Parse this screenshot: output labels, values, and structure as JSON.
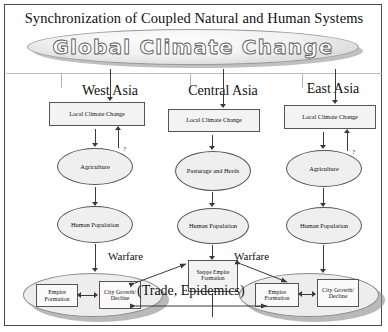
{
  "figure": {
    "title": "Synchronization of Coupled Natural and Human Systems",
    "banner_label": "Global Climate Change"
  },
  "regions": [
    {
      "name": "West Asia",
      "climate_box": "Local Climate Change",
      "subsistence": "Agriculture",
      "population": "Human Population",
      "feedback_marker": "?",
      "outcome_ellipse": {
        "empire": "Empire Formation",
        "city": "City Growth/ Decline"
      }
    },
    {
      "name": "Central Asia",
      "climate_box": "Local Climate Change",
      "subsistence": "Pasturage and Herds",
      "population": "Human Population",
      "outcome_box": "Steppe Empire Formation"
    },
    {
      "name": "East Asia",
      "climate_box": "Local Climate Change",
      "subsistence": "Agriculture",
      "population": "Human Population",
      "feedback_marker": "?",
      "outcome_ellipse": {
        "empire": "Empire Formation",
        "city": "City Growth/ Decline"
      }
    }
  ],
  "links": {
    "warfare_left": "Warfare",
    "warfare_right": "Warfare",
    "trade": "(Trade, Epidemics)"
  },
  "colors": {
    "line": "#3a3a3a",
    "box_fill": "#f3f3f3",
    "node_fill": "#efefef",
    "shadow": "#8e8e8e",
    "frame": "#4a4a4a"
  }
}
